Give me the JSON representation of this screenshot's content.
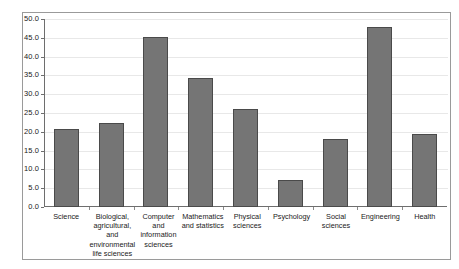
{
  "chart_data": {
    "type": "bar",
    "title": "",
    "subtitle": "",
    "xlabel": "",
    "ylabel": "",
    "ylim": [
      0.0,
      50.0
    ],
    "ytick_step": 5.0,
    "grid": true,
    "legend": "none",
    "bar_color": "#757575",
    "bar_edge_color": "#4a4a4a",
    "grid_color": "#e8e8e8",
    "axis_color": "#6e6e6e",
    "categories": [
      "Science",
      "Biological, agricultural, and environmental life sciences",
      "Computer and information sciences",
      "Mathematics and statistics",
      "Physical sciences",
      "Psychology",
      "Social sciences",
      "Engineering",
      "Health"
    ],
    "values": [
      20.7,
      22.3,
      45.2,
      34.2,
      26.1,
      7.2,
      18.2,
      48.0,
      19.5
    ],
    "ytick_labels": [
      "0.0",
      "5.0",
      "10.0",
      "15.0",
      "20.0",
      "25.0",
      "30.0",
      "35.0",
      "40.0",
      "45.0",
      "50.0"
    ],
    "ytick_values": [
      0.0,
      5.0,
      10.0,
      15.0,
      20.0,
      25.0,
      30.0,
      35.0,
      40.0,
      45.0,
      50.0
    ]
  }
}
